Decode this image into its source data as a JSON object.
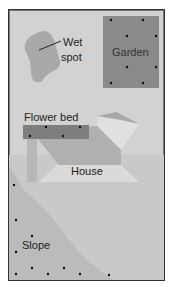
{
  "labels": {
    "wet_spot_line1": "Wet",
    "wet_spot_line2": "spot",
    "garden": "Garden",
    "flower_bed": "Flower bed",
    "house": "House",
    "slope": "Slope"
  },
  "colors": {
    "background": "#d2d2d2",
    "garden": "#8a8a8a",
    "flower_bed": "#7e7e7e",
    "wet_spot": "#a9a9a9",
    "house_dark": "#b0b0b0",
    "house_light": "#dcdcdc",
    "slope": "#b5b5b5",
    "border": "#333333"
  }
}
